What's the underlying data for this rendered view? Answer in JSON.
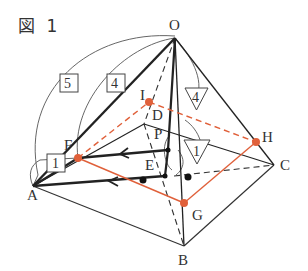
{
  "figure": {
    "title": "図 1"
  },
  "colors": {
    "edge": "#222222",
    "thin": "#444444",
    "accent": "#e0603a",
    "label": "#333333"
  },
  "vertices": {
    "O": "O",
    "A": "A",
    "B": "B",
    "C": "C",
    "D": "D",
    "E": "E",
    "F": "F",
    "G": "G",
    "H": "H",
    "I": "I",
    "P": "P"
  },
  "dimensions": {
    "OA": "5",
    "OF": "4",
    "AF": "1",
    "OH": "4",
    "HC": "1"
  }
}
